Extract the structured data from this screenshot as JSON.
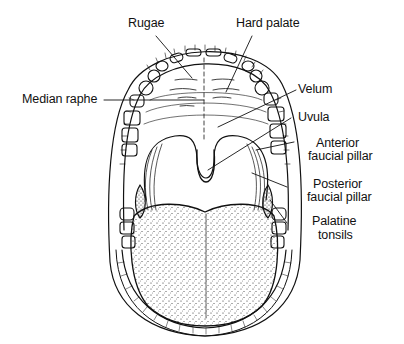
{
  "figure": {
    "colors": {
      "ink": "#111111",
      "background": "#ffffff"
    }
  },
  "labels": {
    "rugae": "Rugae",
    "hard_palate": "Hard palate",
    "median_raphe": "Median raphe",
    "velum": "Velum",
    "uvula": "Uvula",
    "anterior_faucial_pillar_line1": "Anterior",
    "anterior_faucial_pillar_line2": "faucial pillar",
    "posterior_faucial_pillar_line1": "Posterior",
    "posterior_faucial_pillar_line2": "faucial pillar",
    "palatine_tonsils_line1": "Palatine",
    "palatine_tonsils_line2": "tonsils"
  }
}
